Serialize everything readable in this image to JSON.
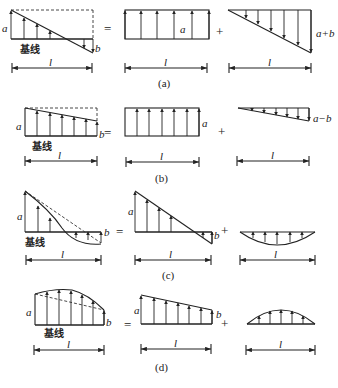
{
  "figure": {
    "baseline_label": "基线",
    "length_label": "l",
    "operators": {
      "equals": "=",
      "plus": "+"
    },
    "panels": [
      {
        "caption": "(a)",
        "left": {
          "a": "a",
          "b": "b"
        },
        "middle": {
          "a": "a"
        },
        "right": {
          "label": "a+b"
        }
      },
      {
        "caption": "(b)",
        "left": {
          "a": "a",
          "b": "b"
        },
        "middle": {
          "a": "a"
        },
        "right": {
          "label": "a−b"
        }
      },
      {
        "caption": "(c)",
        "left": {
          "a": "a",
          "b": "b"
        },
        "middle": {
          "a": "a",
          "b": "b"
        },
        "right": {
          "label": ""
        }
      },
      {
        "caption": "(d)",
        "left": {
          "a": "a",
          "b": "b"
        },
        "middle": {
          "a": "a",
          "b": "b"
        },
        "right": {
          "label": ""
        }
      }
    ]
  }
}
